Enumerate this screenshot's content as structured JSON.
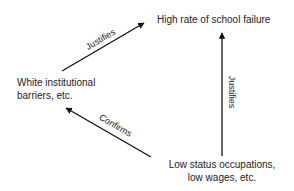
{
  "diagram": {
    "nodes": {
      "top": {
        "label": "High rate of school failure"
      },
      "left": {
        "line1": "White institutional",
        "line2": "barriers, etc."
      },
      "bottom": {
        "line1": "Low status occupations,",
        "line2": "low wages, etc."
      }
    },
    "edges": [
      {
        "from": "left",
        "to": "top",
        "label": "Justifies"
      },
      {
        "from": "bottom",
        "to": "top",
        "label": "Justifies"
      },
      {
        "from": "bottom",
        "to": "left",
        "label": "Confirms"
      }
    ],
    "colors": {
      "stroke": "#111111",
      "text": "#222222",
      "background": "#ffffff"
    }
  }
}
